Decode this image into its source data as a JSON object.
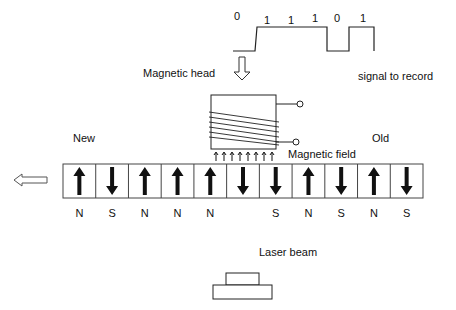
{
  "signal": {
    "label": "signal to record",
    "bits": [
      {
        "value": "0",
        "x": 234,
        "y": 10
      },
      {
        "value": "1",
        "x": 264,
        "y": 14
      },
      {
        "value": "1",
        "x": 288,
        "y": 14
      },
      {
        "value": "1",
        "x": 312,
        "y": 12
      },
      {
        "value": "0",
        "x": 334,
        "y": 12
      },
      {
        "value": "1",
        "x": 360,
        "y": 12
      }
    ]
  },
  "head": {
    "label": "Magnetic head"
  },
  "field": {
    "label": "Magnetic field"
  },
  "tape": {
    "new_label": "New",
    "old_label": "Old",
    "cells": [
      {
        "dir": "up",
        "pole": "N"
      },
      {
        "dir": "down",
        "pole": "S"
      },
      {
        "dir": "up",
        "pole": "N"
      },
      {
        "dir": "up",
        "pole": "N"
      },
      {
        "dir": "up",
        "pole": "N"
      },
      {
        "dir": "down",
        "pole": ""
      },
      {
        "dir": "down",
        "pole": "S"
      },
      {
        "dir": "up",
        "pole": "N"
      },
      {
        "dir": "down",
        "pole": "S"
      },
      {
        "dir": "up",
        "pole": "N"
      },
      {
        "dir": "down",
        "pole": "S"
      }
    ]
  },
  "laser": {
    "label": "Laser beam"
  }
}
